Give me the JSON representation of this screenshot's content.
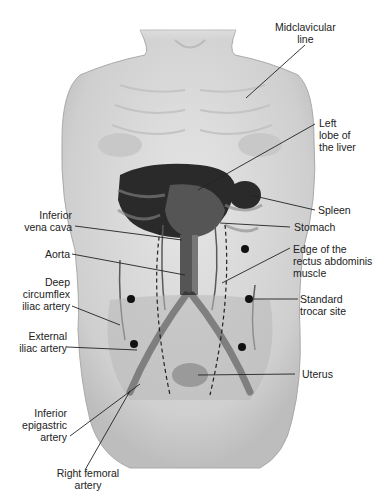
{
  "diagram": {
    "type": "anatomical-illustration",
    "labels": {
      "midclavicular": [
        "Midclavicular",
        "line"
      ],
      "left_lobe": [
        "Left",
        "lobe of",
        "the liver"
      ],
      "spleen": [
        "Spleen"
      ],
      "ivc": [
        "Inferior",
        "vena cava"
      ],
      "stomach": [
        "Stomach"
      ],
      "aorta": [
        "Aorta"
      ],
      "rectus": [
        "Edge of the",
        "rectus abdominis",
        "muscle"
      ],
      "deep_circ": [
        "Deep",
        "circumflex",
        "iliac  artery"
      ],
      "trocar": [
        "Standard",
        "trocar site"
      ],
      "ext_iliac": [
        "External",
        "iliac artery"
      ],
      "uterus": [
        "Uterus"
      ],
      "inf_epi": [
        "Inferior",
        "epigastric",
        "artery"
      ],
      "femoral": [
        "Right femoral",
        "artery"
      ]
    },
    "colors": {
      "skin": "#d9d9d9",
      "organ_dark": "#2a2a2a",
      "vessel": "#4a4a4a",
      "leader": "#222222"
    }
  }
}
